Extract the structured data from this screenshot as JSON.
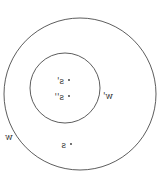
{
  "diagram": {
    "mirrored": true,
    "top_caption": "",
    "circles": [
      {
        "name": "outer",
        "label": "w",
        "cx": 80,
        "cy": 94,
        "r": 76
      },
      {
        "name": "inner",
        "label": "w'",
        "cx": 65,
        "cy": 88,
        "r": 35
      }
    ],
    "points": [
      {
        "label": "s'",
        "x": 69,
        "y": 80
      },
      {
        "label": "s''",
        "x": 69,
        "y": 96
      },
      {
        "label": "s",
        "x": 71,
        "y": 144
      }
    ],
    "colors": {
      "stroke": "#333333",
      "background": "#ffffff"
    }
  }
}
